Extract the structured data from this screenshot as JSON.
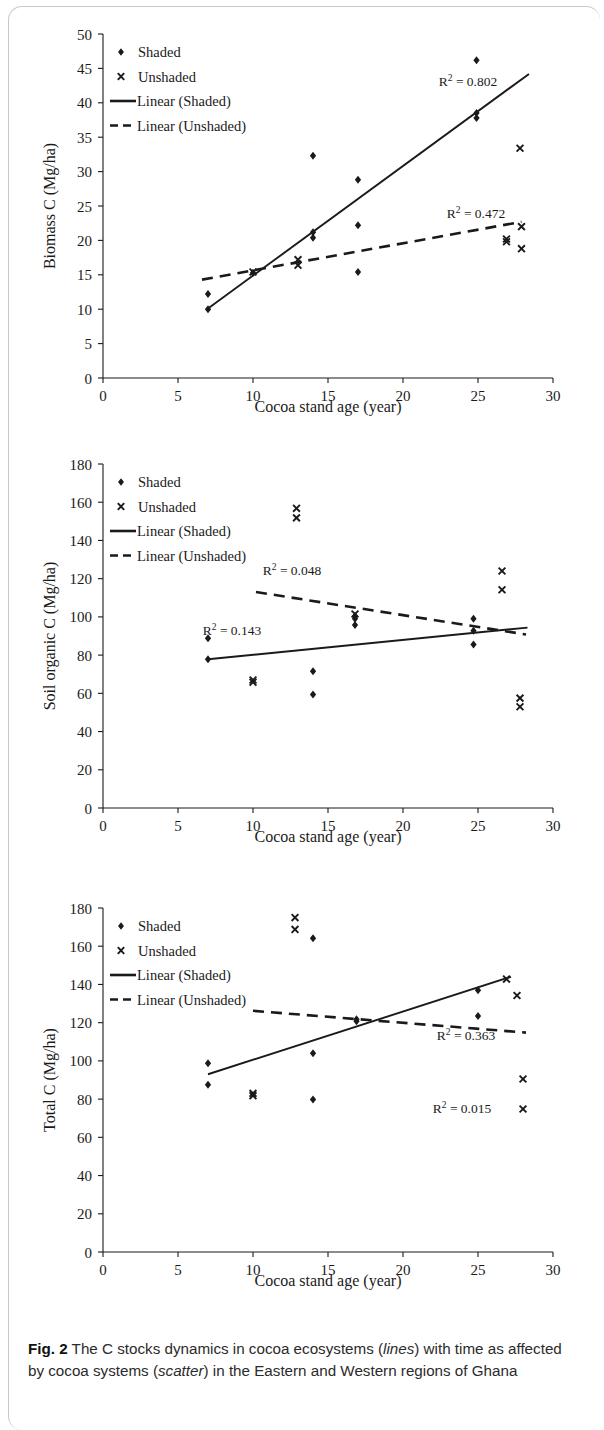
{
  "figure": {
    "label": "Fig. 2",
    "caption_parts": [
      {
        "text": " The C stocks dynamics in cocoa ecosystems (",
        "style": "normal"
      },
      {
        "text": "lines",
        "style": "italic"
      },
      {
        "text": ") with time as affected by cocoa systems (",
        "style": "normal"
      },
      {
        "text": "scatter",
        "style": "italic"
      },
      {
        "text": ") in the Eastern and Western regions of Ghana",
        "style": "normal"
      }
    ]
  },
  "legend": {
    "shaded": "Shaded",
    "unshaded": "Unshaded",
    "linear_shaded": "Linear (Shaded)",
    "linear_unshaded": "Linear (Unshaded)"
  },
  "shared": {
    "xlabel": "Cocoa stand age (year)",
    "xticks": [
      "0",
      "5",
      "10",
      "15",
      "20",
      "25",
      "30"
    ],
    "xlim": [
      0,
      30
    ],
    "marker_shaded": "filled-diamond",
    "marker_unshaded": "x-cross",
    "line_color": "#1a1a1a"
  },
  "chart_data": [
    {
      "type": "scatter",
      "title": "",
      "xlabel": "Cocoa stand age (year)",
      "ylabel": "Biomass  C (Mg/ha)",
      "xlim": [
        0,
        30
      ],
      "ylim": [
        0,
        50
      ],
      "xticks": [
        0,
        5,
        10,
        15,
        20,
        25,
        30
      ],
      "yticks": [
        0,
        5,
        10,
        15,
        20,
        25,
        30,
        35,
        40,
        45,
        50
      ],
      "ytick_labels": [
        "0",
        "5",
        "10",
        "15",
        "20",
        "25",
        "30",
        "35",
        "40",
        "45",
        "50"
      ],
      "grid": false,
      "legend_position": "top-left",
      "series": [
        {
          "name": "Shaded",
          "marker": "filled-diamond",
          "points": [
            [
              7.0,
              10.0
            ],
            [
              7.0,
              12.2
            ],
            [
              10.0,
              15.3
            ],
            [
              14.0,
              32.3
            ],
            [
              14.0,
              21.2
            ],
            [
              14.0,
              20.4
            ],
            [
              17.0,
              28.8
            ],
            [
              17.0,
              22.2
            ],
            [
              17.0,
              15.4
            ],
            [
              24.9,
              46.2
            ],
            [
              24.9,
              38.5
            ],
            [
              24.9,
              37.8
            ]
          ]
        },
        {
          "name": "Unshaded",
          "marker": "x-cross",
          "points": [
            [
              10.0,
              15.4
            ],
            [
              13.0,
              17.2
            ],
            [
              13.0,
              16.4
            ],
            [
              26.9,
              20.2
            ],
            [
              26.9,
              19.8
            ],
            [
              27.8,
              33.4
            ],
            [
              27.9,
              22.0
            ],
            [
              27.9,
              18.8
            ]
          ]
        }
      ],
      "trendlines": [
        {
          "name": "Linear (Shaded)",
          "style": "solid",
          "x0": 7.0,
          "y0": 10.1,
          "x1": 28.4,
          "y1": 44.2,
          "r2_label": "R² = 0.802",
          "r2_value": 0.802
        },
        {
          "name": "Linear (Unshaded)",
          "style": "dashed",
          "x0": 6.6,
          "y0": 14.3,
          "x1": 27.9,
          "y1": 22.7,
          "r2_label": "R² = 0.472",
          "r2_value": 0.472
        }
      ]
    },
    {
      "type": "scatter",
      "title": "",
      "xlabel": "Cocoa stand age (year)",
      "ylabel": "Soil organic C (Mg/ha)",
      "xlim": [
        0,
        30
      ],
      "ylim": [
        0,
        180
      ],
      "xticks": [
        0,
        5,
        10,
        15,
        20,
        25,
        30
      ],
      "yticks": [
        0,
        20,
        40,
        60,
        80,
        100,
        120,
        140,
        160,
        180
      ],
      "ytick_labels": [
        "0",
        "20",
        "40",
        "60",
        "80",
        "100",
        "120",
        "140",
        "160",
        "180"
      ],
      "grid": false,
      "legend_position": "top-left",
      "series": [
        {
          "name": "Shaded",
          "marker": "filled-diamond",
          "points": [
            [
              7.0,
              88.8
            ],
            [
              7.0,
              77.8
            ],
            [
              14.0,
              71.5
            ],
            [
              14.0,
              59.4
            ],
            [
              16.8,
              100.5
            ],
            [
              16.8,
              99.0
            ],
            [
              16.8,
              95.8
            ],
            [
              24.7,
              99.0
            ],
            [
              24.7,
              92.8
            ],
            [
              24.7,
              85.5
            ]
          ]
        },
        {
          "name": "Unshaded",
          "marker": "x-cross",
          "points": [
            [
              10.0,
              67.0
            ],
            [
              10.0,
              65.8
            ],
            [
              12.9,
              156.8
            ],
            [
              12.9,
              151.8
            ],
            [
              16.8,
              101.5
            ],
            [
              26.6,
              124.0
            ],
            [
              26.6,
              114.2
            ],
            [
              27.8,
              57.5
            ],
            [
              27.8,
              53.0
            ]
          ]
        }
      ],
      "trendlines": [
        {
          "name": "Linear (Shaded)",
          "style": "solid",
          "x0": 7.0,
          "y0": 77.8,
          "x1": 28.3,
          "y1": 94.4,
          "r2_label": "R² = 0.143",
          "r2_value": 0.143
        },
        {
          "name": "Linear (Unshaded)",
          "style": "dashed",
          "x0": 10.2,
          "y0": 113.0,
          "x1": 28.2,
          "y1": 90.8,
          "r2_label": "R² = 0.048",
          "r2_value": 0.048
        }
      ]
    },
    {
      "type": "scatter",
      "title": "",
      "xlabel": "Cocoa stand age (year)",
      "ylabel": "Total C (Mg/ha)",
      "xlim": [
        0,
        30
      ],
      "ylim": [
        0,
        180
      ],
      "xticks": [
        0,
        5,
        10,
        15,
        20,
        25,
        30
      ],
      "yticks": [
        0,
        20,
        40,
        60,
        80,
        100,
        120,
        140,
        160,
        180
      ],
      "ytick_labels": [
        "0",
        "20",
        "40",
        "60",
        "80",
        "100",
        "120",
        "140",
        "160",
        "180"
      ],
      "grid": false,
      "legend_position": "top-left",
      "series": [
        {
          "name": "Shaded",
          "marker": "filled-diamond",
          "points": [
            [
              7.0,
              98.8
            ],
            [
              7.0,
              87.5
            ],
            [
              14.0,
              164.2
            ],
            [
              14.0,
              104.0
            ],
            [
              14.0,
              79.8
            ],
            [
              16.9,
              121.8
            ],
            [
              16.9,
              120.8
            ],
            [
              25.0,
              137.0
            ],
            [
              25.0,
              123.5
            ]
          ]
        },
        {
          "name": "Unshaded",
          "marker": "x-cross",
          "points": [
            [
              10.0,
              83.0
            ],
            [
              10.0,
              81.8
            ],
            [
              12.8,
              175.0
            ],
            [
              12.8,
              168.8
            ],
            [
              26.9,
              142.8
            ],
            [
              27.6,
              134.2
            ],
            [
              28.0,
              90.5
            ],
            [
              28.0,
              74.8
            ]
          ]
        }
      ],
      "trendlines": [
        {
          "name": "Linear (Shaded)",
          "style": "solid",
          "x0": 7.0,
          "y0": 93.0,
          "x1": 27.2,
          "y1": 144.0,
          "r2_label": "R² = 0.363",
          "r2_value": 0.363
        },
        {
          "name": "Linear (Unshaded)",
          "style": "dashed",
          "x0": 10.0,
          "y0": 126.2,
          "x1": 28.2,
          "y1": 114.8,
          "r2_label": "R² = 0.015",
          "r2_value": 0.015
        }
      ]
    }
  ]
}
